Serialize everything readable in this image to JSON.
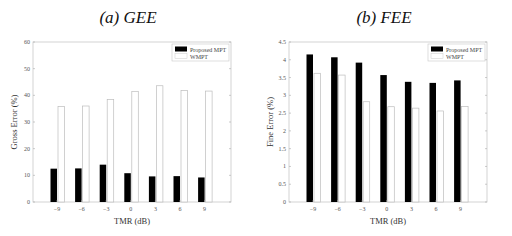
{
  "chart_data": [
    {
      "type": "bar",
      "title": "(a) GEE",
      "xlabel": "TMR (dB)",
      "ylabel": "Gross Error (%)",
      "categories": [
        "-9",
        "-6",
        "-3",
        "0",
        "3",
        "6",
        "9"
      ],
      "ylim": [
        0,
        60
      ],
      "yticks": [
        0,
        10,
        20,
        30,
        40,
        50,
        60
      ],
      "grid": false,
      "legend_position": "upper right",
      "series": [
        {
          "name": "Proposed MPT",
          "color": "#000000",
          "values": [
            12.5,
            12.6,
            14.0,
            10.8,
            9.6,
            9.7,
            9.2
          ]
        },
        {
          "name": "WMPT",
          "color": "#ffffff",
          "values": [
            35.8,
            36.0,
            38.4,
            41.5,
            43.6,
            41.8,
            41.6
          ]
        }
      ]
    },
    {
      "type": "bar",
      "title": "(b) FEE",
      "xlabel": "TMR (dB)",
      "ylabel": "Fine Error (%)",
      "categories": [
        "-9",
        "-6",
        "-3",
        "0",
        "3",
        "6",
        "9"
      ],
      "ylim": [
        0,
        4.5
      ],
      "yticks": [
        0,
        0.5,
        1,
        1.5,
        2,
        2.5,
        3,
        3.5,
        4,
        4.5
      ],
      "grid": false,
      "legend_position": "upper right",
      "series": [
        {
          "name": "Proposed MPT",
          "color": "#000000",
          "values": [
            4.15,
            4.07,
            3.92,
            3.57,
            3.38,
            3.35,
            3.42
          ]
        },
        {
          "name": "WMPT",
          "color": "#ffffff",
          "values": [
            3.62,
            3.57,
            2.82,
            2.68,
            2.64,
            2.56,
            2.69
          ]
        }
      ]
    }
  ],
  "panels": {
    "a": {
      "title": "(a) GEE",
      "xlabel": "TMR (dB)",
      "ylabel": "Gross Error (%)",
      "ytick_labels": [
        "0",
        "10",
        "20",
        "30",
        "40",
        "50",
        "60"
      ],
      "legend": [
        "Proposed MPT",
        "WMPT"
      ]
    },
    "b": {
      "title": "(b) FEE",
      "xlabel": "TMR (dB)",
      "ylabel": "Fine Error (%)",
      "ytick_labels": [
        "0",
        "0.5",
        "1",
        "1.5",
        "2",
        "2.5",
        "3",
        "3.5",
        "4",
        "4.5"
      ],
      "legend": [
        "Proposed MPT",
        "WMPT"
      ]
    }
  },
  "xtick_labels": [
    "−9",
    "−6",
    "−3",
    "0",
    "3",
    "6",
    "9"
  ]
}
